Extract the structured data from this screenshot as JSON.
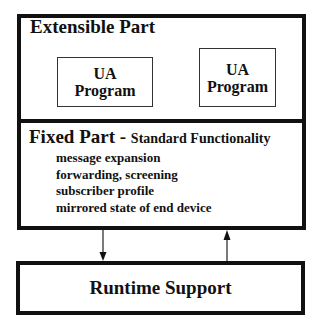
{
  "extensible": {
    "title": "Extensible Part",
    "programs": [
      {
        "line1": "UA",
        "line2": "Program"
      },
      {
        "line1": "UA",
        "line2": "Program"
      }
    ]
  },
  "fixed": {
    "title": "Fixed Part",
    "separator": " - ",
    "subtitle": "Standard Functionality",
    "features": [
      "message expansion",
      "forwarding, screening",
      "subscriber profile",
      "mirrored state of end device"
    ]
  },
  "runtime": {
    "label": "Runtime Support"
  },
  "arrows": [
    {
      "direction": "down",
      "from": "fixed",
      "to": "runtime"
    },
    {
      "direction": "up",
      "from": "runtime",
      "to": "fixed"
    }
  ]
}
